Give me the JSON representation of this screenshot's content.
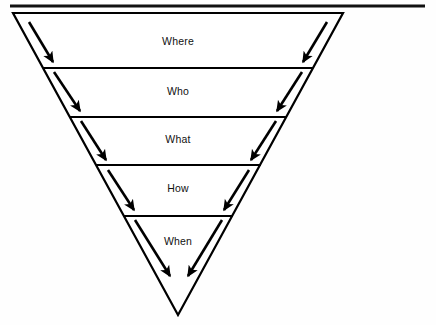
{
  "figure": {
    "shape": "inverted-triangle",
    "background_color": "#ffffff",
    "line_color": "#000000",
    "text_color": "#111111"
  },
  "top_rule": {
    "name": "horizontal-rule",
    "x1": 10,
    "x2": 425,
    "y": 6,
    "thickness": 3,
    "color": "#111111"
  },
  "pyramid": {
    "apex": {
      "x": 178,
      "y": 315
    },
    "top_left": {
      "x": 13,
      "y": 13
    },
    "top_right": {
      "x": 343,
      "y": 13
    },
    "stroke_width": 2.2
  },
  "bands": [
    {
      "id": "band-where",
      "label": "Where",
      "label_x": 178,
      "label_y": 45,
      "top_y": 13,
      "bottom_y": 68
    },
    {
      "id": "band-who",
      "label": "Who",
      "label_x": 178,
      "label_y": 95,
      "top_y": 68,
      "bottom_y": 117
    },
    {
      "id": "band-what",
      "label": "What",
      "label_x": 178,
      "label_y": 143,
      "top_y": 117,
      "bottom_y": 165
    },
    {
      "id": "band-how",
      "label": "How",
      "label_x": 178,
      "label_y": 192,
      "top_y": 165,
      "bottom_y": 216
    },
    {
      "id": "band-when",
      "label": "When",
      "label_x": 178,
      "label_y": 245,
      "top_y": 216,
      "bottom_y": 315
    }
  ],
  "dividers": [
    {
      "id": "divider-1",
      "y": 68,
      "x1": 43,
      "x2": 313
    },
    {
      "id": "divider-2",
      "y": 117,
      "x1": 70,
      "x2": 287
    },
    {
      "id": "divider-3",
      "y": 165,
      "x1": 96,
      "x2": 261
    },
    {
      "id": "divider-4",
      "y": 216,
      "x1": 124,
      "x2": 233
    }
  ],
  "arrows": [
    {
      "id": "arrow-left-1",
      "side": "left",
      "band": "Where",
      "x1": 29,
      "y1": 22,
      "x2": 53,
      "y2": 62
    },
    {
      "id": "arrow-left-2",
      "side": "left",
      "band": "Who",
      "x1": 54,
      "y1": 72,
      "x2": 80,
      "y2": 111
    },
    {
      "id": "arrow-left-3",
      "side": "left",
      "band": "What",
      "x1": 81,
      "y1": 121,
      "x2": 106,
      "y2": 160
    },
    {
      "id": "arrow-left-4",
      "side": "left",
      "band": "How",
      "x1": 108,
      "y1": 170,
      "x2": 134,
      "y2": 210
    },
    {
      "id": "arrow-left-5",
      "side": "left",
      "band": "When",
      "x1": 135,
      "y1": 220,
      "x2": 170,
      "y2": 276
    },
    {
      "id": "arrow-right-1",
      "side": "right",
      "band": "Where",
      "x1": 327,
      "y1": 22,
      "x2": 303,
      "y2": 62
    },
    {
      "id": "arrow-right-2",
      "side": "right",
      "band": "Who",
      "x1": 302,
      "y1": 72,
      "x2": 277,
      "y2": 111
    },
    {
      "id": "arrow-right-3",
      "side": "right",
      "band": "What",
      "x1": 276,
      "y1": 121,
      "x2": 251,
      "y2": 160
    },
    {
      "id": "arrow-right-4",
      "side": "right",
      "band": "How",
      "x1": 249,
      "y1": 170,
      "x2": 224,
      "y2": 210
    },
    {
      "id": "arrow-right-5",
      "side": "right",
      "band": "When",
      "x1": 222,
      "y1": 220,
      "x2": 188,
      "y2": 276
    }
  ]
}
